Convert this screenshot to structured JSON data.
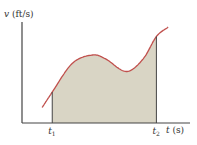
{
  "chart_data": {
    "type": "area",
    "title": "",
    "ylabel": {
      "var": "v",
      "unit": " (ft/s)"
    },
    "xlabel": {
      "var": "t",
      "unit": " (s)"
    },
    "xticks": [
      {
        "var": "t",
        "sub": "1",
        "x": 0.18
      },
      {
        "var": "t",
        "sub": "2",
        "x": 0.8
      }
    ],
    "curve": {
      "description": "velocity curve rising, local max, local min, then rising",
      "x": [
        0.12,
        0.18,
        0.3,
        0.42,
        0.5,
        0.62,
        0.72,
        0.8,
        0.87
      ],
      "y": [
        0.15,
        0.3,
        0.58,
        0.66,
        0.62,
        0.5,
        0.62,
        0.84,
        0.93
      ]
    },
    "shaded_region": {
      "from": "t1",
      "to": "t2"
    },
    "xlim": [
      0,
      1
    ],
    "ylim": [
      0,
      1
    ],
    "grid": false,
    "colors": {
      "curve": "#c0504d",
      "fill": "#d9d5c5",
      "axis": "#444444"
    }
  }
}
